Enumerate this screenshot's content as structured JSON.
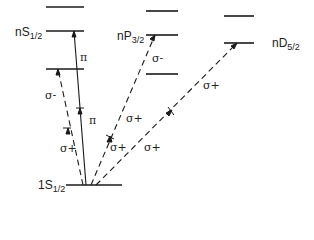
{
  "diagram": {
    "type": "energy-level transition diagram",
    "levels": {
      "nS": {
        "label_main": "nS",
        "label_sub": "1/2"
      },
      "nP": {
        "label_main": "nP",
        "label_sub": "3/2"
      },
      "nD": {
        "label_main": "nD",
        "label_sub": "5/2"
      },
      "ground": {
        "label_main": "1S",
        "label_sub": "1/2"
      }
    },
    "transitions": [
      {
        "from": "1S1/2",
        "to": "nS1/2 (lower)",
        "polarization": "σ+",
        "then": "σ-",
        "style": "dashed"
      },
      {
        "from": "1S1/2",
        "to": "nS1/2",
        "polarization": "π",
        "then": "π",
        "style": "solid"
      },
      {
        "from": "1S1/2",
        "to": "nP3/2",
        "polarization": "σ+",
        "then": "σ-",
        "style": "dashed"
      },
      {
        "from": "1S1/2",
        "to": "nD5/2",
        "polarization": "σ+",
        "then": "σ+",
        "style": "dashed"
      }
    ],
    "labels": {
      "pi_upper": "π",
      "pi_lower": "π",
      "sigma_minus_s": "σ-",
      "sigma_plus_s": "σ+",
      "sigma_minus_p": "σ-",
      "sigma_plus_p": "σ+",
      "sigma_plus_p2": "σ+",
      "sigma_plus_d": "σ+",
      "sigma_plus_d2": "σ+"
    },
    "colors": {
      "line": "#1a1a1a",
      "background": "#ffffff"
    }
  }
}
